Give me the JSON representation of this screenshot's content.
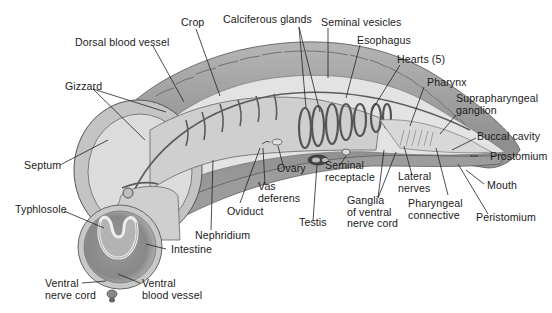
{
  "diagram": {
    "colors": {
      "background": "#ffffff",
      "body_wall": "#9a9a9a",
      "body_wall_dark": "#6e6e6e",
      "interior": "#d9d9d9",
      "interior_light": "#ececec",
      "vessels": "#555555",
      "leader_lines": "#222222",
      "text": "#1a1a1a"
    },
    "labels": [
      {
        "id": "crop",
        "text": "Crop"
      },
      {
        "id": "calciferous-glands",
        "text": "Calciferous glands"
      },
      {
        "id": "seminal-vesicles",
        "text": "Seminal vesicles"
      },
      {
        "id": "esophagus",
        "text": "Esophagus"
      },
      {
        "id": "dorsal-blood-vessel",
        "text": "Dorsal blood vessel"
      },
      {
        "id": "hearts",
        "text": "Hearts (5)"
      },
      {
        "id": "pharynx",
        "text": "Pharynx"
      },
      {
        "id": "gizzard",
        "text": "Gizzard"
      },
      {
        "id": "suprapharyngeal-ganglion",
        "text": [
          "Suprapharyngeal",
          "ganglion"
        ]
      },
      {
        "id": "buccal-cavity",
        "text": "Buccal cavity"
      },
      {
        "id": "prostomium",
        "text": "Prostomium"
      },
      {
        "id": "septum",
        "text": "Septum"
      },
      {
        "id": "ovary",
        "text": "Ovary"
      },
      {
        "id": "seminal-receptacle",
        "text": [
          "Seminal",
          "receptacle"
        ]
      },
      {
        "id": "lateral-nerves",
        "text": [
          "Lateral",
          "nerves"
        ]
      },
      {
        "id": "mouth",
        "text": "Mouth"
      },
      {
        "id": "vas-deferens",
        "text": [
          "Vas",
          "deferens"
        ]
      },
      {
        "id": "typhlosole",
        "text": "Typhlosole"
      },
      {
        "id": "oviduct",
        "text": "Oviduct"
      },
      {
        "id": "ganglia-ventral-nerve-cord",
        "text": [
          "Ganglia",
          "of ventral",
          "nerve cord"
        ]
      },
      {
        "id": "pharyngeal-connective",
        "text": [
          "Pharyngeal",
          "connective"
        ]
      },
      {
        "id": "peristomium",
        "text": "Peristomium"
      },
      {
        "id": "testis",
        "text": "Testis"
      },
      {
        "id": "nephridium",
        "text": "Nephridium"
      },
      {
        "id": "intestine",
        "text": "Intestine"
      },
      {
        "id": "ventral-nerve-cord",
        "text": [
          "Ventral",
          "nerve cord"
        ]
      },
      {
        "id": "ventral-blood-vessel",
        "text": [
          "Ventral",
          "blood vessel"
        ]
      }
    ]
  },
  "text": {
    "crop": "Crop",
    "calciferous_glands": "Calciferous glands",
    "seminal_vesicles": "Seminal vesicles",
    "esophagus": "Esophagus",
    "dorsal_blood_vessel": "Dorsal blood vessel",
    "hearts": "Hearts (5)",
    "pharynx": "Pharynx",
    "gizzard": "Gizzard",
    "suprapharyngeal_1": "Suprapharyngeal",
    "suprapharyngeal_2": "ganglion",
    "buccal_cavity": "Buccal cavity",
    "prostomium": "Prostomium",
    "septum": "Septum",
    "ovary": "Ovary",
    "seminal_receptacle_1": "Seminal",
    "seminal_receptacle_2": "receptacle",
    "lateral_nerves_1": "Lateral",
    "lateral_nerves_2": "nerves",
    "mouth": "Mouth",
    "vas_deferens_1": "Vas",
    "vas_deferens_2": "deferens",
    "typhlosole": "Typhlosole",
    "oviduct": "Oviduct",
    "ganglia_1": "Ganglia",
    "ganglia_2": "of ventral",
    "ganglia_3": "nerve cord",
    "pharyngeal_connective_1": "Pharyngeal",
    "pharyngeal_connective_2": "connective",
    "peristomium": "Peristomium",
    "testis": "Testis",
    "nephridium": "Nephridium",
    "intestine": "Intestine",
    "ventral_nerve_cord_1": "Ventral",
    "ventral_nerve_cord_2": "nerve cord",
    "ventral_blood_vessel_1": "Ventral",
    "ventral_blood_vessel_2": "blood vessel"
  }
}
